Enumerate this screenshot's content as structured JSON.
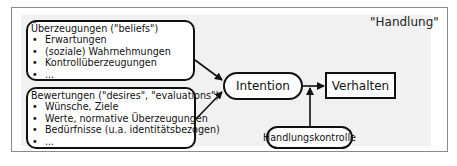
{
  "diagram": {
    "title": "\"Handlung\"",
    "beliefs": {
      "heading": "Überzeugungen (\"beliefs\")",
      "items": [
        "Erwartungen",
        "(soziale) Wahrnehmungen",
        "Kontrollüberzeugungen",
        "..."
      ]
    },
    "desires": {
      "heading": "Bewertungen (\"desires\", \"evaluations\")",
      "items": [
        "Wünsche, Ziele",
        "Werte, normative Überzeugungen",
        "Bedürfnisse (u.a. identitätsbezogen)",
        "..."
      ]
    },
    "intention": "Intention",
    "behavior": "Verhalten",
    "control": "Handlungskontrolle",
    "edges": [
      {
        "from": "beliefs",
        "to": "intention"
      },
      {
        "from": "desires",
        "to": "intention"
      },
      {
        "from": "intention",
        "to": "behavior"
      },
      {
        "from": "control",
        "to": "behavior"
      }
    ]
  }
}
